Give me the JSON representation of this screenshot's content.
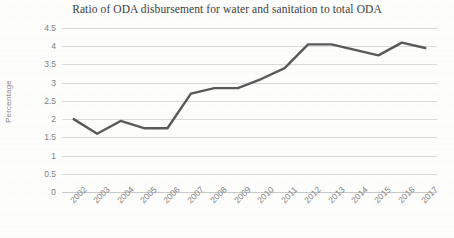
{
  "chart_data": {
    "type": "line",
    "title": "Ratio of ODA disbursement for water and sanitation to total ODA",
    "xlabel": "",
    "ylabel": "Percentage",
    "categories": [
      "2002",
      "2003",
      "2004",
      "2005",
      "2006",
      "2007",
      "2008",
      "2009",
      "2010",
      "2011",
      "2012",
      "2013",
      "2014",
      "2015",
      "2016",
      "2017"
    ],
    "values": [
      2.0,
      1.6,
      1.95,
      1.75,
      1.75,
      2.7,
      2.85,
      2.85,
      3.1,
      3.4,
      4.05,
      4.05,
      3.9,
      3.75,
      4.1,
      3.95
    ],
    "series": [
      {
        "name": "Ratio of ODA disbursement for water and sanitation to total ODA",
        "values": [
          2.0,
          1.6,
          1.95,
          1.75,
          1.75,
          2.7,
          2.85,
          2.85,
          3.1,
          3.4,
          4.05,
          4.05,
          3.9,
          3.75,
          4.1,
          3.95
        ]
      }
    ],
    "ylim": [
      0,
      4.5
    ],
    "yticks": [
      0,
      0.5,
      1,
      1.5,
      2,
      2.5,
      3,
      3.5,
      4,
      4.5
    ],
    "ytick_labels": [
      "0",
      "0.5",
      "1",
      "1.5",
      "2",
      "2.5",
      "3",
      "3.5",
      "4",
      "4.5"
    ],
    "grid": true,
    "legend": false,
    "legend_position": "none",
    "line_color": "#595959",
    "grid_color": "#d9d9d9",
    "tick_label_color": "#7f7f7f",
    "title_color": "#3c3c3c"
  }
}
